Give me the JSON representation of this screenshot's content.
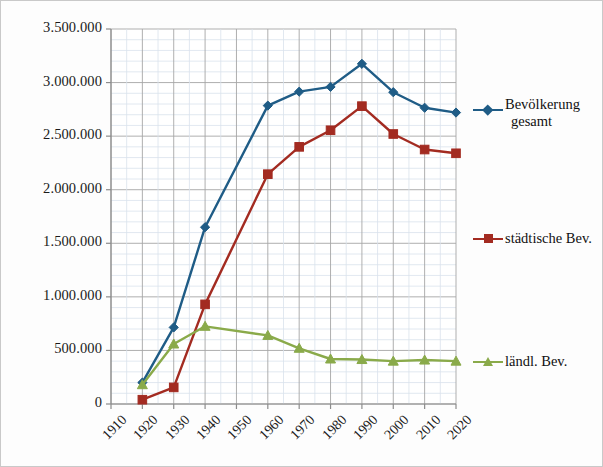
{
  "chart_data": {
    "type": "line",
    "title": "",
    "xlabel": "",
    "ylabel": "",
    "x": [
      1920,
      1930,
      1940,
      1950,
      1960,
      1970,
      1980,
      1990,
      2000,
      2010,
      2020
    ],
    "tick_labels_x": [
      "1910",
      "1920",
      "1930",
      "1940",
      "1950",
      "1960",
      "1970",
      "1980",
      "1990",
      "2000",
      "2010",
      "2020"
    ],
    "tick_labels_y": [
      "0",
      "500.000",
      "1.000.000",
      "1.500.000",
      "2.000.000",
      "2.500.000",
      "3.000.000",
      "3.500.000"
    ],
    "xlim": [
      1910,
      2020
    ],
    "ylim": [
      0,
      3500000
    ],
    "ytick_step": 500000,
    "yminor_step": 100000,
    "grid": true,
    "legend_position": "right",
    "series": [
      {
        "name": "Bevölkerung gesamt",
        "name_line1": "Bevölkerung",
        "name_line2": "gesamt",
        "color": "#1f5c86",
        "marker": "diamond",
        "values": [
          200000,
          715000,
          1650000,
          null,
          2785000,
          2915000,
          2960000,
          3175000,
          2910000,
          2765000,
          2720000
        ]
      },
      {
        "name": "städtische Bev.",
        "color": "#a32b21",
        "marker": "square",
        "values": [
          40000,
          155000,
          930000,
          null,
          2145000,
          2400000,
          2555000,
          2780000,
          2520000,
          2375000,
          2340000
        ]
      },
      {
        "name": "ländl. Bev.",
        "color": "#8aaa4a",
        "marker": "triangle",
        "values": [
          180000,
          560000,
          725000,
          null,
          640000,
          520000,
          420000,
          415000,
          400000,
          410000,
          400000
        ]
      }
    ]
  },
  "axes": {
    "major_grid_color": "#a6a6a6",
    "minor_grid_color": "#d9e2ec",
    "axis_color": "#8c8c8c",
    "border_color": "#c9c9c9"
  }
}
